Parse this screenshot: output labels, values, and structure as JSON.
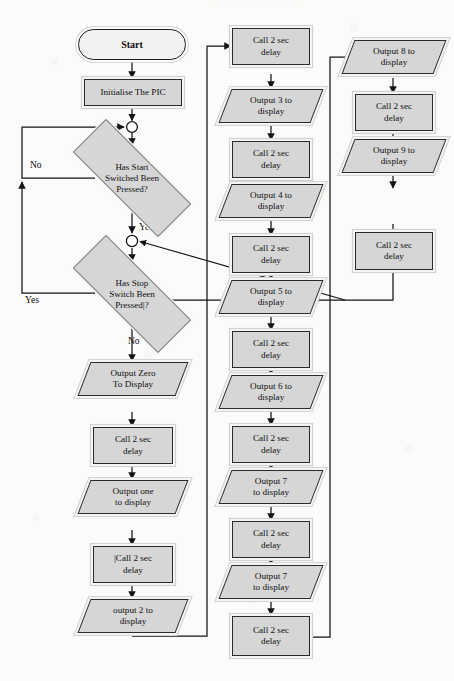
{
  "document": {
    "type": "flowchart",
    "title": "PIC seven-segment counter flowchart",
    "background_color": "#fbfbfa",
    "shape_fill": "#d6d6d6",
    "shape_border": "#2b2b2b"
  },
  "nodes": {
    "start": {
      "label": "Start",
      "shape": "terminator"
    },
    "init": {
      "label": "Initialise The PIC",
      "shape": "process"
    },
    "decision_start": {
      "line1": "Has Start",
      "line2": "Switched  Been",
      "line3": "Pressed?",
      "shape": "decision"
    },
    "decision_stop": {
      "line1": "Has Stop",
      "line2": "Switch  Been",
      "line3": "Pressed|?",
      "shape": "decision"
    },
    "out_zero": {
      "line1": "Output Zero",
      "line2": "To Display",
      "shape": "io"
    },
    "delay_a": {
      "line1": "Call 2 sec",
      "line2": "delay",
      "shape": "process"
    },
    "out_one": {
      "line1": "Output one",
      "line2": "to display",
      "shape": "io"
    },
    "delay_b": {
      "line1": "|Call 2 sec",
      "line2": "delay",
      "shape": "process"
    },
    "out_two": {
      "line1": "output 2 to",
      "line2": "display",
      "shape": "io"
    },
    "delay_c": {
      "line1": "Call 2 sec",
      "line2": "delay",
      "shape": "process"
    },
    "out_three": {
      "line1": "Output 3 to",
      "line2": "display",
      "shape": "io"
    },
    "delay_d": {
      "line1": "Call 2 sec",
      "line2": "delay",
      "shape": "process"
    },
    "out_four": {
      "line1": "Output 4 to",
      "line2": "display",
      "shape": "io"
    },
    "delay_e": {
      "line1": "Call 2 sec",
      "line2": "delay",
      "shape": "process"
    },
    "out_five": {
      "line1": "Output 5 to",
      "line2": "display",
      "shape": "io"
    },
    "delay_f": {
      "line1": "Call 2 sec",
      "line2": "delay",
      "shape": "process"
    },
    "out_six": {
      "line1": "Output 6 to",
      "line2": "display",
      "shape": "io"
    },
    "delay_g": {
      "line1": "Call 2 sec",
      "line2": "delay",
      "shape": "process"
    },
    "out_seven": {
      "line1": "Output 7",
      "line2": "to display",
      "shape": "io"
    },
    "delay_h": {
      "line1": "Call 2 sec",
      "line2": "delay",
      "shape": "process"
    },
    "out_eight": {
      "line1": "Output 8 to",
      "line2": "display",
      "shape": "io"
    },
    "delay_i": {
      "line1": "Call 2 sec",
      "line2": "delay",
      "shape": "process"
    },
    "out_nine": {
      "line1": "Output 9 to",
      "line2": "display",
      "shape": "io"
    },
    "delay_j": {
      "line1": "Call 2 sec",
      "line2": "delay",
      "shape": "process"
    }
  },
  "edge_labels": {
    "start_no": "No",
    "start_yes": "Yes",
    "stop_yes": "Yes",
    "stop_no": "No"
  }
}
